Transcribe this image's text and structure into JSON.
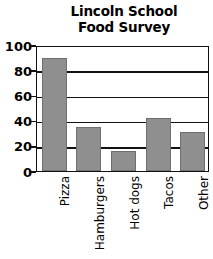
{
  "chart_data": {
    "type": "bar",
    "title": "Lincoln School Food Survey",
    "title_lines": [
      "Lincoln School",
      "Food Survey"
    ],
    "categories": [
      "Pizza",
      "Hamburgers",
      "Hot dogs",
      "Tacos",
      "Other"
    ],
    "values": [
      90,
      35,
      16,
      42,
      31
    ],
    "xlabel": "",
    "ylabel": "",
    "ylim": [
      0,
      100
    ],
    "yticks": [
      0,
      20,
      40,
      60,
      80,
      100
    ],
    "ytick_labels": [
      "0",
      "20",
      "40",
      "60",
      "80",
      "100"
    ],
    "grid": true,
    "legend": false,
    "bar_color": "#8f8f8f",
    "axis_color": "#111111",
    "background": "#ffffff"
  }
}
